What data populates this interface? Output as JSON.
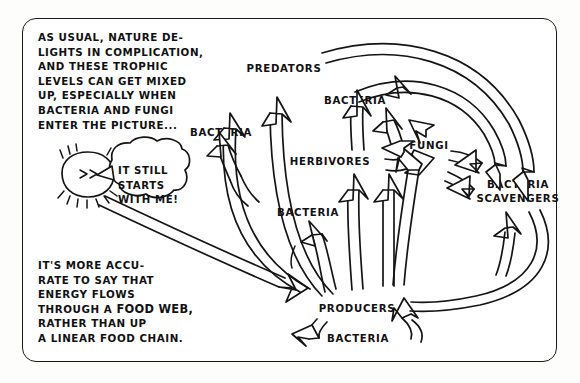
{
  "panel": {
    "caption_top": "AS USUAL, NATURE DE-\nLIGHTS IN COMPLICATION,\nAND THESE TROPHIC\nLEVELS CAN GET MIXED\nUP, ESPECIALLY WHEN\nBACTERIA AND FUNGI\nENTER THE PICTURE...",
    "caption_bottom_part1": "IT'S MORE ACCU-\nRATE TO SAY THAT\nENERGY FLOWS\nTHROUGH A ",
    "caption_bottom_emphasis": "FOOD WEB,",
    "caption_bottom_part2": " RATHER THAN UP\nA LINEAR FOOD CHAIN."
  },
  "character": {
    "name": "sun-character",
    "face": "> >",
    "speech": "IT STILL\nSTARTS\nWITH ME!"
  },
  "diagram": {
    "type": "food-web",
    "nodes": [
      {
        "id": "predators",
        "label": "PREDATORS",
        "x": 284,
        "y": 69
      },
      {
        "id": "bacteria-left",
        "label": "BACTERIA",
        "x": 221,
        "y": 133
      },
      {
        "id": "bacteria-upper",
        "label": "BACTERIA",
        "x": 355,
        "y": 101
      },
      {
        "id": "herbivores",
        "label": "HERBIVORES",
        "x": 330,
        "y": 162
      },
      {
        "id": "fungi",
        "label": "FUNGI",
        "x": 429,
        "y": 146
      },
      {
        "id": "bacteria-scavengers",
        "label": "BACTERIA\nSCAVENGERS",
        "x": 518,
        "y": 191
      },
      {
        "id": "bacteria-mid",
        "label": "BACTERIA",
        "x": 308,
        "y": 213
      },
      {
        "id": "producers",
        "label": "PRODUCERS",
        "x": 357,
        "y": 309
      },
      {
        "id": "bacteria-bottom",
        "label": "BACTERIA",
        "x": 358,
        "y": 339
      }
    ],
    "edges": [
      {
        "from": "producers",
        "to": "predators"
      },
      {
        "from": "producers",
        "to": "herbivores"
      },
      {
        "from": "herbivores",
        "to": "predators"
      },
      {
        "from": "herbivores",
        "to": "bacteria-upper"
      },
      {
        "from": "herbivores",
        "to": "fungi"
      },
      {
        "from": "predators",
        "to": "bacteria-left"
      },
      {
        "from": "predators",
        "to": "bacteria-scavengers"
      },
      {
        "from": "producers",
        "to": "bacteria-mid"
      },
      {
        "from": "producers",
        "to": "fungi"
      },
      {
        "from": "fungi",
        "to": "producers"
      },
      {
        "from": "bacteria-scavengers",
        "to": "producers"
      },
      {
        "from": "sun",
        "to": "producers"
      }
    ]
  },
  "colors": {
    "ink": "#141414",
    "paper": "#ffffff"
  }
}
